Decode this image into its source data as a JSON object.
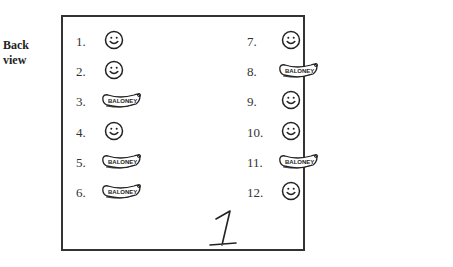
{
  "side_label": {
    "line1": "Back",
    "line2": "view"
  },
  "items": [
    {
      "number": "1.",
      "type": "smiley"
    },
    {
      "number": "2.",
      "type": "smiley"
    },
    {
      "number": "3.",
      "type": "baloney",
      "text": "BALONEY"
    },
    {
      "number": "4.",
      "type": "smiley"
    },
    {
      "number": "5.",
      "type": "baloney",
      "text": "BALONEY"
    },
    {
      "number": "6.",
      "type": "baloney",
      "text": "BALONEY"
    },
    {
      "number": "7.",
      "type": "smiley"
    },
    {
      "number": "8.",
      "type": "baloney",
      "text": "BALONEY"
    },
    {
      "number": "9.",
      "type": "smiley"
    },
    {
      "number": "10.",
      "type": "smiley"
    },
    {
      "number": "11.",
      "type": "baloney",
      "text": "BALONEY"
    },
    {
      "number": "12.",
      "type": "smiley"
    }
  ],
  "card_number": "1"
}
